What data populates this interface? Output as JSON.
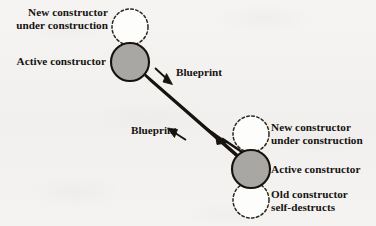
{
  "figure": {
    "name": "self-replicating-constructor-diagram",
    "background_color": "#f3f2f0",
    "ink_color": "#16130f",
    "active_fill_color": "#a9a7a4"
  },
  "nodes": {
    "left_cluster": {
      "new_constructor": {
        "label_line1": "New constructor",
        "label_line2": "under construction",
        "style": "dashed-circle",
        "cx": 130,
        "cy": 27,
        "r": 18
      },
      "active_constructor": {
        "label_line1": "Active constructor",
        "style": "filled-circle",
        "cx": 130,
        "cy": 62,
        "r": 19
      }
    },
    "right_cluster": {
      "new_constructor": {
        "label_line1": "New constructor",
        "label_line2": "under construction",
        "style": "dashed-circle",
        "cx": 251,
        "cy": 134,
        "r": 18
      },
      "active_constructor": {
        "label_line1": "Active constructor",
        "style": "filled-circle",
        "cx": 251,
        "cy": 169,
        "r": 19
      },
      "old_constructor": {
        "label_line1": "Old constructor",
        "label_line2": "self-destructs",
        "style": "dashed-circle",
        "cx": 251,
        "cy": 200,
        "r": 18
      }
    }
  },
  "connectors": {
    "beam": {
      "name": "blueprint-transmission-beam",
      "from_x": 144,
      "from_y": 74,
      "to_x": 243,
      "to_y": 160
    },
    "blueprint_top": {
      "label": "Blueprint",
      "arrow_direction": "down-right"
    },
    "blueprint_bottom": {
      "label": "Blueprint",
      "arrow_direction": "up-left"
    }
  }
}
